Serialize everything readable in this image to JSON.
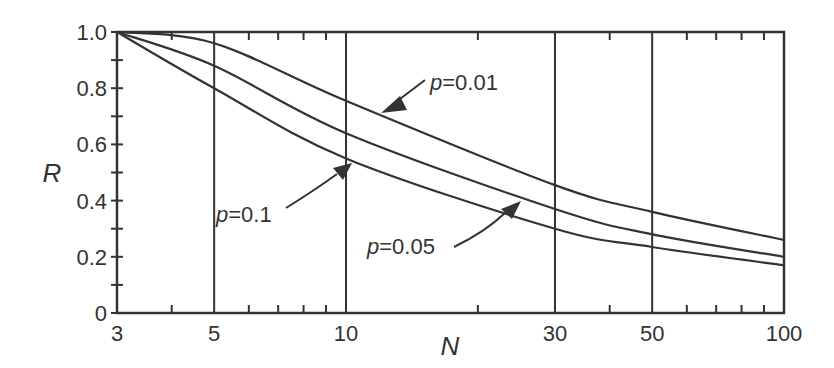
{
  "chart_data": {
    "type": "line",
    "title": "",
    "xlabel": "N",
    "ylabel": "R",
    "xscale": "log",
    "xlim": [
      3,
      100
    ],
    "ylim": [
      0,
      1.0
    ],
    "x_ticks": [
      3,
      5,
      10,
      30,
      50,
      100
    ],
    "x_tick_labels": [
      "3",
      "5",
      "10",
      "30",
      "50",
      "100"
    ],
    "y_ticks": [
      0,
      0.2,
      0.4,
      0.6,
      0.8,
      1.0
    ],
    "y_tick_labels": [
      "0",
      "0.2",
      "0.4",
      "0.6",
      "0.8",
      "1.0"
    ],
    "vertical_gridlines": [
      5,
      10,
      30,
      50
    ],
    "x": [
      3,
      5,
      10,
      30,
      50,
      100
    ],
    "series": [
      {
        "name": "p=0.01",
        "values": [
          1.0,
          0.96,
          0.755,
          0.455,
          0.36,
          0.26
        ]
      },
      {
        "name": "p=0.05",
        "values": [
          1.0,
          0.88,
          0.64,
          0.37,
          0.28,
          0.2
        ]
      },
      {
        "name": "p=0.1",
        "values": [
          1.0,
          0.8,
          0.55,
          0.3,
          0.235,
          0.17
        ]
      }
    ],
    "annotations": [
      {
        "label_prefix": "p",
        "label_value": "=0.01",
        "target_series": "p=0.01"
      },
      {
        "label_prefix": "p",
        "label_value": "=0.05",
        "target_series": "p=0.05"
      },
      {
        "label_prefix": "p",
        "label_value": "=0.1",
        "target_series": "p=0.1"
      }
    ],
    "legend": "none (inline arrow annotations)"
  }
}
